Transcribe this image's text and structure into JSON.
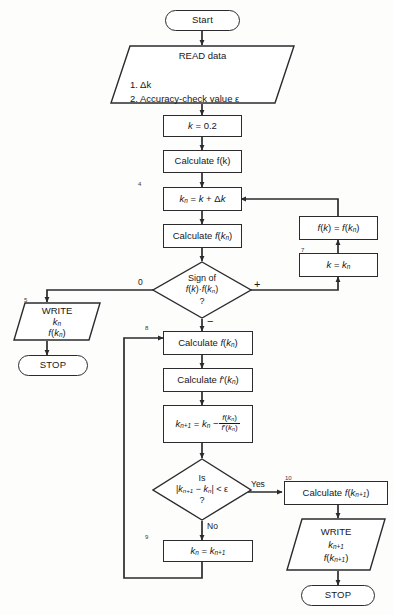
{
  "figure": {
    "kind": "flowchart",
    "background_color": "#fdfdfc",
    "line_color": "#2b2b2e"
  },
  "nodes": {
    "start": {
      "label": "Start",
      "shape": "terminator"
    },
    "read_data": {
      "shape": "input-output",
      "heading": "READ data",
      "items": [
        "1.  Δk",
        "2.  Accuracy-check value ε"
      ]
    },
    "init_k": {
      "shape": "process",
      "label_html": "k = 0.2"
    },
    "calc_fk": {
      "shape": "process",
      "label": "Calculate f(k)"
    },
    "step4": {
      "number": "4",
      "shape": "process",
      "label_html": "kₙ = k + Δk"
    },
    "calc_fkn": {
      "shape": "process",
      "label_html": "Calculate f(kₙ)"
    },
    "sign_decision": {
      "shape": "decision",
      "line1": "Sign of",
      "line2": "f(k)·f(kₙ)",
      "line3": "?",
      "branch_left": "0",
      "branch_right": "+",
      "branch_down": "−"
    },
    "write5": {
      "number": "5",
      "shape": "input-output",
      "heading": "WRITE",
      "items": [
        "kₙ",
        "f(kₙ)"
      ]
    },
    "stop_left": {
      "label": "STOP",
      "shape": "terminator"
    },
    "assign_fk": {
      "shape": "process",
      "label_html": "f(k) = f(kₙ)"
    },
    "step7": {
      "number": "7",
      "shape": "process",
      "label_html": "k = kₙ"
    },
    "step8": {
      "number": "8",
      "shape": "process",
      "label_html": "Calculate f(kₙ)"
    },
    "calc_fprime": {
      "shape": "process",
      "label_html": "Calculate f'(kₙ)"
    },
    "newton_update": {
      "shape": "process",
      "lhs": "kₙ₊₁ = kₙ −",
      "fraction_numerator": "f(kₙ)",
      "fraction_denominator": "f'(kₙ)"
    },
    "converged_decision": {
      "shape": "decision",
      "line1": "Is",
      "line2": "|kₙ₊₁ − kₙ| < ε",
      "line3": "?",
      "branch_right": "Yes",
      "branch_down": "No"
    },
    "step9": {
      "number": "9",
      "shape": "process",
      "label_html": "kₙ = kₙ₊₁"
    },
    "step10": {
      "number": "10",
      "shape": "process",
      "label_html": "Calculate f(kₙ₊₁)"
    },
    "write_final": {
      "shape": "input-output",
      "heading": "WRITE",
      "items": [
        "kₙ₊₁",
        "f(kₙ₊₁)"
      ]
    },
    "stop_right": {
      "label": "STOP",
      "shape": "terminator"
    }
  }
}
